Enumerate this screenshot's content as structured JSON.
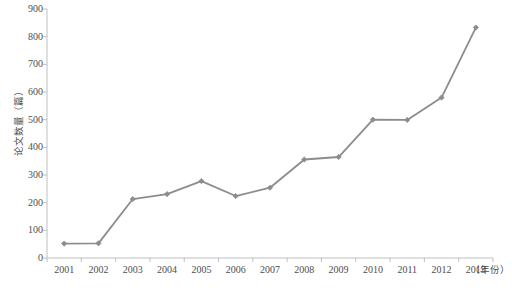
{
  "chart_data": {
    "type": "line",
    "title": "",
    "xlabel": "（年份）",
    "ylabel": "论文数量（篇）",
    "categories": [
      "2001",
      "2002",
      "2003",
      "2004",
      "2005",
      "2006",
      "2007",
      "2008",
      "2009",
      "2010",
      "2011",
      "2012",
      "2013"
    ],
    "values": [
      52,
      53,
      213,
      231,
      278,
      224,
      254,
      356,
      365,
      500,
      499,
      580,
      833
    ],
    "series": [
      {
        "name": "论文数量",
        "values": [
          52,
          53,
          213,
          231,
          278,
          224,
          254,
          356,
          365,
          500,
          499,
          580,
          833
        ]
      }
    ],
    "ylim": [
      0,
      900
    ],
    "ytick_values": [
      0,
      100,
      200,
      300,
      400,
      500,
      600,
      700,
      800,
      900
    ],
    "ytick_labels": [
      "0",
      "100",
      "200",
      "300",
      "400",
      "500",
      "600",
      "700",
      "800",
      "900"
    ],
    "xtick_labels": [
      "2001",
      "2002",
      "2003",
      "2004",
      "2005",
      "2006",
      "2007",
      "2008",
      "2009",
      "2010",
      "2011",
      "2012",
      "2013"
    ],
    "grid": false,
    "legend": null,
    "legend_position": "none",
    "marker": "diamond",
    "line_color": "#8c8c8c",
    "marker_color": "#8c8c8c",
    "axis_color": "#bfbfbf",
    "text_color": "#4d4d4d"
  }
}
